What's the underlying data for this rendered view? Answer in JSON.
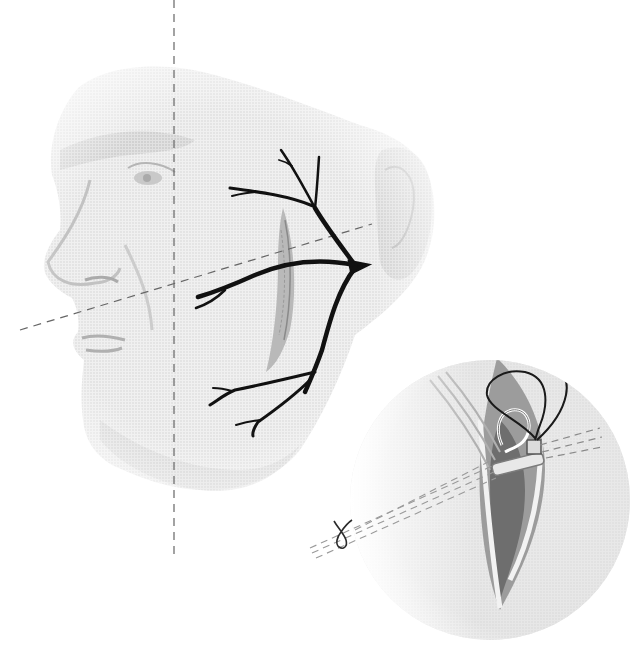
{
  "figure": {
    "type": "medical-illustration",
    "subject": "facial nerve branches over parotid incision with magnified surgical inset",
    "text_labels": []
  },
  "colors": {
    "background": "#ffffff",
    "face_shading": "#d4d4d4",
    "face_shadow": "#bdbdbd",
    "nerve": "#111111",
    "dashed_guides": "#666666",
    "inset_fill": "#e4e4e4",
    "inset_edge": "#c8c8c8",
    "wound_dark": "#6e6e6e",
    "suture": "#1a1a1a"
  },
  "elements": {
    "face": {
      "name": "elderly male face, left profile, soft grayscale",
      "region": [
        40,
        60,
        440,
        490
      ]
    },
    "ear": {
      "name": "ear",
      "center": [
        405,
        220
      ]
    },
    "incision": {
      "name": "preauricular/cheek incision",
      "from": [
        285,
        210
      ],
      "to": [
        265,
        370
      ]
    },
    "nerve_trunk": {
      "name": "facial nerve trunk",
      "origin": [
        362,
        265
      ]
    },
    "nerve_branches": [
      {
        "name": "temporal branch",
        "tip": [
          281,
          150
        ]
      },
      {
        "name": "temporal branch 2",
        "tip": [
          319,
          157
        ]
      },
      {
        "name": "zygomatic branch",
        "tip": [
          230,
          188
        ]
      },
      {
        "name": "buccal branch",
        "tip": [
          198,
          297
        ]
      },
      {
        "name": "marginal mandibular branch",
        "tip": [
          210,
          405
        ]
      },
      {
        "name": "cervical branch",
        "tip": [
          253,
          435
        ]
      }
    ],
    "guide_vertical": {
      "name": "vertical dashed guide",
      "x": 174,
      "y1": 0,
      "y2": 560
    },
    "guide_horizontal": {
      "name": "oblique dashed guide",
      "from": [
        20,
        330
      ],
      "to": [
        370,
        224
      ]
    },
    "inset": {
      "name": "magnified surgical view",
      "center": [
        490,
        500
      ],
      "radius": 140
    },
    "suture_knot": {
      "name": "suture knot",
      "position": [
        340,
        535
      ]
    }
  }
}
